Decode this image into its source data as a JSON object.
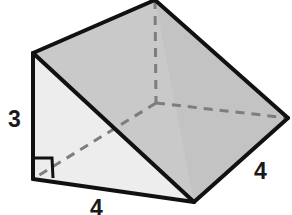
{
  "figure": {
    "name": "triangular-prism-wedge",
    "background_color": "#ffffff",
    "edge_color": "#111111",
    "hidden_edge_color": "#7d7d7d",
    "faces": {
      "top_slant_color": "#c9c9c9",
      "right_slant_color": "#c2c2c2",
      "left_triangle_color": "#ececec",
      "front_bottom_color": "#e4e4e4"
    },
    "labels": {
      "height": "3",
      "depth": "4",
      "width": "4"
    },
    "right_angle_marker": {
      "present": true,
      "label": "right-angle"
    },
    "vertices": {
      "top_apex": [
        155,
        0
      ],
      "left_top": [
        33,
        53
      ],
      "right": [
        288,
        118
      ],
      "bottom": [
        194,
        202
      ],
      "bottom_left": [
        33,
        179
      ],
      "hidden_back": [
        156,
        103
      ]
    }
  }
}
